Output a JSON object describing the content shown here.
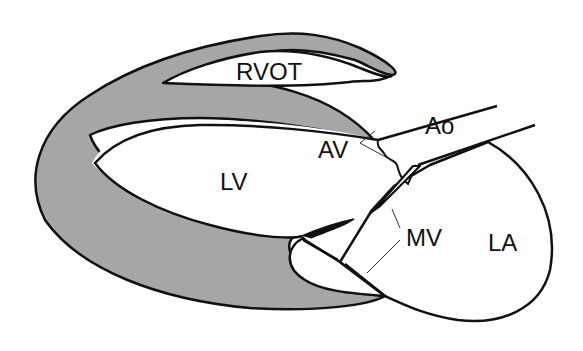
{
  "diagram": {
    "colors": {
      "background": "#ffffff",
      "myocardium": "#a6a6a6",
      "outline": "#111111",
      "chamber": "#ffffff"
    },
    "labels": {
      "rvot": "RVOT",
      "ao": "Ao",
      "av": "AV",
      "lv": "LV",
      "mv": "MV",
      "la": "LA"
    }
  }
}
